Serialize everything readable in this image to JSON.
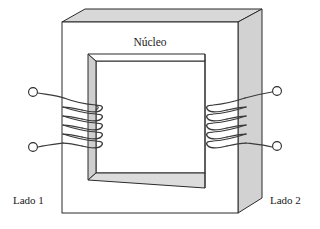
{
  "figure": {
    "title_label": "Núcleo",
    "side_left_label": "Lado 1",
    "side_right_label": "Lado 2",
    "core": {
      "face_fill": "#ffffff",
      "top_face_fill": "#d8d8d8",
      "side_face_fill": "#d0d0d0",
      "inner_left_fill": "#cfcfcf",
      "inner_bottom_fill": "#dcdcdc",
      "stroke": "#2b2b2b"
    },
    "coils": {
      "turns_left": 5,
      "turns_right": 5,
      "wire_color": "#3a3a3a",
      "terminal_fill": "#ffffff",
      "terminal_stroke": "#2b2b2b"
    },
    "terminals": [
      {
        "name": "left-upper-terminal",
        "cx": 33,
        "cy": 92
      },
      {
        "name": "left-lower-terminal",
        "cx": 33,
        "cy": 147
      },
      {
        "name": "right-upper-terminal",
        "cx": 277,
        "cy": 91
      },
      {
        "name": "right-lower-terminal",
        "cx": 277,
        "cy": 146
      }
    ]
  }
}
